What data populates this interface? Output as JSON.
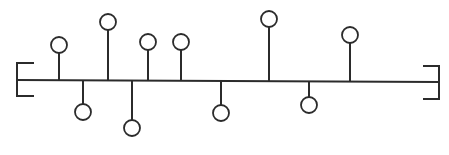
{
  "diagram": {
    "type": "linear-chain-with-pendant-nodes",
    "colors": {
      "stroke": "#2b2b2b",
      "fill": "#ffffff",
      "background": "#ffffff"
    },
    "backbone": {
      "x1": 17,
      "y1": 80,
      "x2": 439,
      "y2": 82
    },
    "left_bracket": {
      "x": 17,
      "top": 63,
      "bottom": 96,
      "arm_end": 34
    },
    "right_bracket": {
      "x": 439,
      "top": 66,
      "bottom": 99,
      "arm_end": 423
    },
    "node_radius": 8,
    "nodes": [
      {
        "id": "n1",
        "side": "up",
        "x": 59,
        "cy": 45
      },
      {
        "id": "n2",
        "side": "down",
        "x": 83,
        "cy": 112
      },
      {
        "id": "n3",
        "side": "up",
        "x": 108,
        "cy": 22
      },
      {
        "id": "n4",
        "side": "down",
        "x": 132,
        "cy": 128
      },
      {
        "id": "n5",
        "side": "up",
        "x": 148,
        "cy": 42
      },
      {
        "id": "n6",
        "side": "up",
        "x": 181,
        "cy": 42
      },
      {
        "id": "n7",
        "side": "down",
        "x": 221,
        "cy": 113
      },
      {
        "id": "n8",
        "side": "up",
        "x": 269,
        "cy": 19
      },
      {
        "id": "n9",
        "side": "down",
        "x": 309,
        "cy": 105
      },
      {
        "id": "n10",
        "side": "up",
        "x": 350,
        "cy": 35
      }
    ]
  }
}
